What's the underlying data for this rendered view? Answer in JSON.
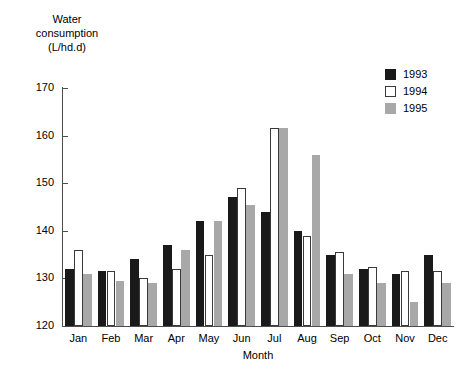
{
  "chart_data": {
    "type": "bar",
    "title": "",
    "ylabel": "Water\nconsumption\n(L/hd.d)",
    "xlabel": "Month",
    "ylim": [
      120,
      170
    ],
    "yticks": [
      120,
      130,
      140,
      150,
      160,
      170
    ],
    "grid": false,
    "legend_position": "top-right",
    "categories": [
      "Jan",
      "Feb",
      "Mar",
      "Apr",
      "May",
      "Jun",
      "Jul",
      "Aug",
      "Sep",
      "Oct",
      "Nov",
      "Dec"
    ],
    "series": [
      {
        "name": "1993",
        "color": "#1a1a1a",
        "values": [
          132,
          131.5,
          134,
          137,
          142,
          147,
          144,
          140,
          135,
          132,
          131,
          135
        ]
      },
      {
        "name": "1994",
        "color": "#ffffff",
        "values": [
          136,
          131.5,
          130,
          132,
          135,
          149,
          161.5,
          139,
          135.5,
          132.5,
          131.5,
          131.5
        ]
      },
      {
        "name": "1995",
        "color": "#a8a8a8",
        "values": [
          131,
          129.5,
          129,
          136,
          142,
          145.5,
          161.5,
          156,
          131,
          129,
          125,
          129
        ]
      }
    ]
  },
  "legend": {
    "entries": [
      {
        "label": "1993"
      },
      {
        "label": "1994"
      },
      {
        "label": "1995"
      }
    ]
  },
  "axes": {
    "y_title": "Water\nconsumption\n(L/hd.d)",
    "x_title": "Month",
    "y_tick_labels": [
      "170",
      "160",
      "150",
      "140",
      "130",
      "120"
    ],
    "x_tick_labels": [
      "Jan",
      "Feb",
      "Mar",
      "Apr",
      "May",
      "Jun",
      "Jul",
      "Aug",
      "Sep",
      "Oct",
      "Nov",
      "Dec"
    ]
  }
}
